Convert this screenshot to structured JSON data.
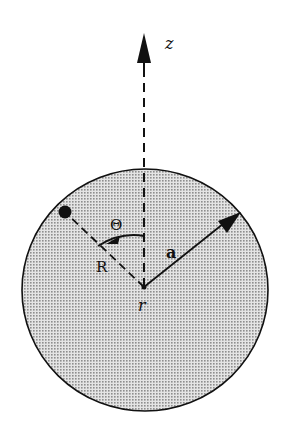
{
  "diagram": {
    "type": "physics-geometry",
    "labels": {
      "z_axis": "z",
      "theta": "Θ",
      "R": "R",
      "a": "a",
      "r": "r"
    },
    "colors": {
      "fill_dots": "#9a9a9a",
      "fill_bg": "#e2e2e2",
      "stroke": "#111111",
      "background": "#ffffff"
    },
    "geometry": {
      "circle_center": [
        145,
        289
      ],
      "circle_radius": 122,
      "origin_point": [
        144,
        287
      ],
      "z_arrow_tip": [
        120,
        33
      ],
      "a_arrow_tip": [
        240,
        213
      ],
      "point_dot": [
        65,
        212
      ]
    }
  }
}
